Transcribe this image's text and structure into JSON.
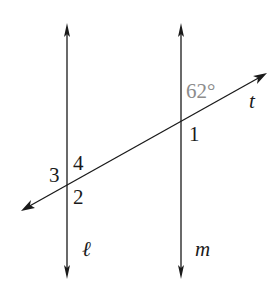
{
  "diagram": {
    "colors": {
      "line": "#1a1a1a",
      "given_angle": "#8c8c8c",
      "background": "#ffffff"
    },
    "lines": [
      {
        "id": "l",
        "label": "ℓ",
        "kind": "parallel",
        "orientation": "vertical"
      },
      {
        "id": "m",
        "label": "m",
        "kind": "parallel",
        "orientation": "vertical"
      },
      {
        "id": "t",
        "label": "t",
        "kind": "transversal"
      }
    ],
    "given_angle": {
      "label": "62°",
      "value_degrees": 62,
      "location": "above transversal t, right of line m"
    },
    "angle_labels": [
      {
        "number": "1",
        "location": "below t, right of m"
      },
      {
        "number": "2",
        "location": "below t, right of ℓ"
      },
      {
        "number": "3",
        "location": "above t, left of ℓ"
      },
      {
        "number": "4",
        "location": "above t, right of ℓ"
      }
    ]
  }
}
